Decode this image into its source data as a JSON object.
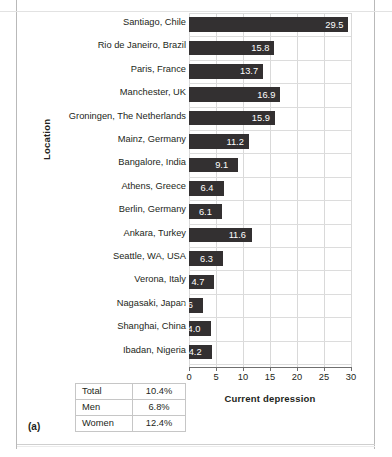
{
  "figure": {
    "letter": "(a)"
  },
  "chart_data": {
    "type": "bar",
    "orientation": "horizontal",
    "title": "",
    "xlabel": "Current depression",
    "ylabel": "Location",
    "xlim": [
      0,
      30
    ],
    "xticks": [
      0,
      5,
      10,
      15,
      20,
      25,
      30
    ],
    "grid": true,
    "legend": "none",
    "bar_color": "#333031",
    "value_label_color": "#ffffff",
    "categories": [
      "Santiago, Chile",
      "Rio de Janeiro, Brazil",
      "Paris, France",
      "Manchester, UK",
      "Groningen, The Netherlands",
      "Mainz, Germany",
      "Bangalore, India",
      "Athens, Greece",
      "Berlin, Germany",
      "Ankara, Turkey",
      "Seattle, WA, USA",
      "Verona, Italy",
      "Nagasaki, Japan",
      "Shanghai, China",
      "Ibadan, Nigeria"
    ],
    "values": [
      29.5,
      15.8,
      13.7,
      16.9,
      15.9,
      11.2,
      9.1,
      6.4,
      6.1,
      11.6,
      6.3,
      4.7,
      2.6,
      4.0,
      4.2
    ],
    "value_labels": [
      "29.5",
      "15.8",
      "13.7",
      "16.9",
      "15.9",
      "11.2",
      "9.1",
      "6.4",
      "6.1",
      "11.6",
      "6.3",
      "4.7",
      "2.6",
      "4.0",
      "4.2"
    ]
  },
  "summary_table": {
    "rows": [
      {
        "label": "Total",
        "value": "10.4%"
      },
      {
        "label": "Men",
        "value": "6.8%"
      },
      {
        "label": "Women",
        "value": "12.4%"
      }
    ]
  }
}
